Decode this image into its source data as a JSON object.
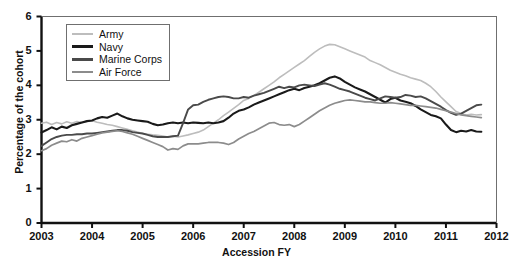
{
  "chart_data": {
    "type": "line",
    "title": "",
    "xlabel": "Accession FY",
    "ylabel": "Percentage of the cohort",
    "xlim": [
      2003,
      2012
    ],
    "ylim": [
      0,
      6
    ],
    "xticks": [
      "2003",
      "2004",
      "2005",
      "2006",
      "2007",
      "2008",
      "2009",
      "2010",
      "2011",
      "2012"
    ],
    "yticks": [
      "0",
      "1",
      "2",
      "3",
      "4",
      "5",
      "6"
    ],
    "grid": false,
    "legend_position": "top-left",
    "colors": {
      "army": "#bdbdbd",
      "navy": "#1a1a1a",
      "marine_corps": "#4a4a4a",
      "air_force": "#8c8c8c"
    },
    "series": [
      {
        "name": "Army",
        "color": "#bdbdbd",
        "width": 1.6,
        "x": [
          2003.0,
          2003.1,
          2003.2,
          2003.3,
          2003.4,
          2003.5,
          2003.6,
          2003.7,
          2003.8,
          2003.9,
          2004.0,
          2004.1,
          2004.2,
          2004.3,
          2004.4,
          2004.5,
          2004.6,
          2004.7,
          2004.8,
          2004.9,
          2005.0,
          2005.1,
          2005.2,
          2005.3,
          2005.4,
          2005.5,
          2005.6,
          2005.7,
          2005.8,
          2005.9,
          2006.0,
          2006.1,
          2006.2,
          2006.3,
          2006.4,
          2006.5,
          2006.6,
          2006.7,
          2006.8,
          2006.9,
          2007.0,
          2007.1,
          2007.2,
          2007.3,
          2007.4,
          2007.5,
          2007.6,
          2007.7,
          2007.8,
          2007.9,
          2008.0,
          2008.1,
          2008.2,
          2008.3,
          2008.4,
          2008.5,
          2008.6,
          2008.7,
          2008.8,
          2008.9,
          2009.0,
          2009.1,
          2009.2,
          2009.3,
          2009.4,
          2009.5,
          2009.6,
          2009.7,
          2009.8,
          2009.9,
          2010.0,
          2010.1,
          2010.2,
          2010.3,
          2010.4,
          2010.5,
          2010.6,
          2010.7,
          2010.8,
          2010.9,
          2011.0,
          2011.1,
          2011.2,
          2011.3,
          2011.4,
          2011.5,
          2011.6,
          2011.7
        ],
        "values": [
          2.9,
          2.93,
          2.86,
          2.92,
          2.88,
          2.94,
          2.9,
          2.95,
          2.92,
          2.96,
          2.97,
          2.93,
          2.9,
          2.86,
          2.84,
          2.8,
          2.76,
          2.72,
          2.68,
          2.64,
          2.6,
          2.58,
          2.56,
          2.55,
          2.53,
          2.5,
          2.52,
          2.5,
          2.53,
          2.56,
          2.6,
          2.64,
          2.7,
          2.8,
          2.9,
          3.0,
          3.12,
          3.22,
          3.33,
          3.44,
          3.56,
          3.62,
          3.7,
          3.8,
          3.9,
          4.0,
          4.1,
          4.22,
          4.32,
          4.42,
          4.52,
          4.62,
          4.72,
          4.84,
          4.96,
          5.06,
          5.14,
          5.19,
          5.18,
          5.12,
          5.06,
          5.0,
          4.94,
          4.88,
          4.82,
          4.72,
          4.66,
          4.6,
          4.52,
          4.44,
          4.38,
          4.32,
          4.28,
          4.22,
          4.18,
          4.14,
          4.06,
          3.96,
          3.82,
          3.66,
          3.52,
          3.38,
          3.24,
          3.18,
          3.14,
          3.16,
          3.14,
          3.15
        ]
      },
      {
        "name": "Navy",
        "color": "#1a1a1a",
        "width": 2.1,
        "x": [
          2003.0,
          2003.1,
          2003.2,
          2003.3,
          2003.4,
          2003.5,
          2003.6,
          2003.7,
          2003.8,
          2003.9,
          2004.0,
          2004.1,
          2004.2,
          2004.3,
          2004.4,
          2004.5,
          2004.6,
          2004.7,
          2004.8,
          2004.9,
          2005.0,
          2005.1,
          2005.2,
          2005.3,
          2005.4,
          2005.5,
          2005.6,
          2005.7,
          2005.8,
          2005.9,
          2006.0,
          2006.1,
          2006.2,
          2006.3,
          2006.4,
          2006.5,
          2006.6,
          2006.7,
          2006.8,
          2006.9,
          2007.0,
          2007.1,
          2007.2,
          2007.3,
          2007.4,
          2007.5,
          2007.6,
          2007.7,
          2007.8,
          2007.9,
          2008.0,
          2008.1,
          2008.2,
          2008.3,
          2008.4,
          2008.5,
          2008.6,
          2008.7,
          2008.8,
          2008.9,
          2009.0,
          2009.1,
          2009.2,
          2009.3,
          2009.4,
          2009.5,
          2009.6,
          2009.7,
          2009.8,
          2009.9,
          2010.0,
          2010.1,
          2010.2,
          2010.3,
          2010.4,
          2010.5,
          2010.6,
          2010.7,
          2010.8,
          2010.9,
          2011.0,
          2011.1,
          2011.2,
          2011.3,
          2011.4,
          2011.5,
          2011.6,
          2011.7
        ],
        "values": [
          2.63,
          2.7,
          2.78,
          2.72,
          2.8,
          2.76,
          2.84,
          2.88,
          2.92,
          2.96,
          2.98,
          3.04,
          3.08,
          3.06,
          3.12,
          3.18,
          3.1,
          3.04,
          3.0,
          2.98,
          2.96,
          2.94,
          2.88,
          2.84,
          2.86,
          2.9,
          2.92,
          2.9,
          2.92,
          2.9,
          2.92,
          2.91,
          2.9,
          2.92,
          2.9,
          2.92,
          2.96,
          3.06,
          3.18,
          3.26,
          3.3,
          3.36,
          3.44,
          3.5,
          3.56,
          3.62,
          3.68,
          3.74,
          3.8,
          3.86,
          3.9,
          3.86,
          3.92,
          3.96,
          4.0,
          4.06,
          4.14,
          4.22,
          4.26,
          4.2,
          4.1,
          4.02,
          3.94,
          3.88,
          3.82,
          3.74,
          3.66,
          3.58,
          3.5,
          3.6,
          3.64,
          3.56,
          3.52,
          3.48,
          3.4,
          3.3,
          3.22,
          3.14,
          3.1,
          3.04,
          2.86,
          2.7,
          2.64,
          2.68,
          2.66,
          2.7,
          2.66,
          2.65
        ]
      },
      {
        "name": "Marine Corps",
        "color": "#4a4a4a",
        "width": 1.9,
        "x": [
          2003.0,
          2003.1,
          2003.2,
          2003.3,
          2003.4,
          2003.5,
          2003.6,
          2003.7,
          2003.8,
          2003.9,
          2004.0,
          2004.1,
          2004.2,
          2004.3,
          2004.4,
          2004.5,
          2004.6,
          2004.7,
          2004.8,
          2004.9,
          2005.0,
          2005.1,
          2005.2,
          2005.3,
          2005.4,
          2005.5,
          2005.6,
          2005.7,
          2005.8,
          2005.9,
          2006.0,
          2006.1,
          2006.2,
          2006.3,
          2006.4,
          2006.5,
          2006.6,
          2006.7,
          2006.8,
          2006.9,
          2007.0,
          2007.1,
          2007.2,
          2007.3,
          2007.4,
          2007.5,
          2007.6,
          2007.7,
          2007.8,
          2007.9,
          2008.0,
          2008.1,
          2008.2,
          2008.3,
          2008.4,
          2008.5,
          2008.6,
          2008.7,
          2008.8,
          2008.9,
          2009.0,
          2009.1,
          2009.2,
          2009.3,
          2009.4,
          2009.5,
          2009.6,
          2009.7,
          2009.8,
          2009.9,
          2010.0,
          2010.1,
          2010.2,
          2010.3,
          2010.4,
          2010.5,
          2010.6,
          2010.7,
          2010.8,
          2010.9,
          2011.0,
          2011.1,
          2011.2,
          2011.3,
          2011.4,
          2011.5,
          2011.6,
          2011.7
        ],
        "values": [
          2.24,
          2.34,
          2.44,
          2.5,
          2.54,
          2.56,
          2.56,
          2.58,
          2.58,
          2.6,
          2.6,
          2.62,
          2.64,
          2.66,
          2.68,
          2.7,
          2.7,
          2.68,
          2.64,
          2.62,
          2.6,
          2.56,
          2.52,
          2.5,
          2.5,
          2.5,
          2.52,
          2.54,
          2.9,
          3.3,
          3.42,
          3.44,
          3.52,
          3.58,
          3.62,
          3.66,
          3.68,
          3.66,
          3.62,
          3.62,
          3.66,
          3.64,
          3.7,
          3.74,
          3.78,
          3.84,
          3.9,
          3.96,
          3.92,
          3.96,
          3.94,
          4.0,
          4.02,
          4.0,
          3.98,
          4.02,
          4.06,
          4.02,
          3.96,
          3.9,
          3.86,
          3.82,
          3.76,
          3.7,
          3.64,
          3.6,
          3.56,
          3.62,
          3.68,
          3.66,
          3.64,
          3.66,
          3.72,
          3.7,
          3.66,
          3.68,
          3.62,
          3.54,
          3.46,
          3.38,
          3.28,
          3.2,
          3.14,
          3.18,
          3.26,
          3.34,
          3.42,
          3.44
        ]
      },
      {
        "name": "Air Force",
        "color": "#8c8c8c",
        "width": 1.7,
        "x": [
          2003.0,
          2003.1,
          2003.2,
          2003.3,
          2003.4,
          2003.5,
          2003.6,
          2003.7,
          2003.8,
          2003.9,
          2004.0,
          2004.1,
          2004.2,
          2004.3,
          2004.4,
          2004.5,
          2004.6,
          2004.7,
          2004.8,
          2004.9,
          2005.0,
          2005.1,
          2005.2,
          2005.3,
          2005.4,
          2005.5,
          2005.6,
          2005.7,
          2005.8,
          2005.9,
          2006.0,
          2006.1,
          2006.2,
          2006.3,
          2006.4,
          2006.5,
          2006.6,
          2006.7,
          2006.8,
          2006.9,
          2007.0,
          2007.1,
          2007.2,
          2007.3,
          2007.4,
          2007.5,
          2007.6,
          2007.7,
          2007.8,
          2007.9,
          2008.0,
          2008.1,
          2008.2,
          2008.3,
          2008.4,
          2008.5,
          2008.6,
          2008.7,
          2008.8,
          2008.9,
          2009.0,
          2009.1,
          2009.2,
          2009.3,
          2009.4,
          2009.5,
          2009.6,
          2009.7,
          2009.8,
          2009.9,
          2010.0,
          2010.1,
          2010.2,
          2010.3,
          2010.4,
          2010.5,
          2010.6,
          2010.7,
          2010.8,
          2010.9,
          2011.0,
          2011.1,
          2011.2,
          2011.3,
          2011.4,
          2011.5,
          2011.6,
          2011.7
        ],
        "values": [
          2.1,
          2.16,
          2.26,
          2.32,
          2.38,
          2.36,
          2.42,
          2.38,
          2.46,
          2.5,
          2.54,
          2.58,
          2.62,
          2.64,
          2.66,
          2.68,
          2.66,
          2.62,
          2.58,
          2.52,
          2.46,
          2.4,
          2.34,
          2.28,
          2.22,
          2.12,
          2.16,
          2.14,
          2.24,
          2.3,
          2.3,
          2.3,
          2.32,
          2.34,
          2.34,
          2.34,
          2.32,
          2.28,
          2.34,
          2.44,
          2.52,
          2.6,
          2.66,
          2.74,
          2.82,
          2.9,
          2.92,
          2.86,
          2.84,
          2.86,
          2.8,
          2.86,
          2.96,
          3.06,
          3.16,
          3.26,
          3.34,
          3.42,
          3.48,
          3.52,
          3.56,
          3.58,
          3.56,
          3.54,
          3.52,
          3.52,
          3.5,
          3.48,
          3.48,
          3.5,
          3.48,
          3.46,
          3.44,
          3.42,
          3.42,
          3.4,
          3.38,
          3.36,
          3.34,
          3.3,
          3.26,
          3.22,
          3.18,
          3.14,
          3.12,
          3.1,
          3.08,
          3.06
        ]
      }
    ]
  },
  "legend": {
    "items": [
      {
        "label": "Army"
      },
      {
        "label": "Navy"
      },
      {
        "label": "Marine Corps"
      },
      {
        "label": "Air Force"
      }
    ]
  },
  "axes": {
    "x_title": "Accession FY",
    "y_title": "Percentage of the cohort",
    "x_ticks": [
      "2003",
      "2004",
      "2005",
      "2006",
      "2007",
      "2008",
      "2009",
      "2010",
      "2011",
      "2012"
    ],
    "y_ticks": [
      "6",
      "5",
      "4",
      "3",
      "2",
      "1",
      "0"
    ]
  }
}
